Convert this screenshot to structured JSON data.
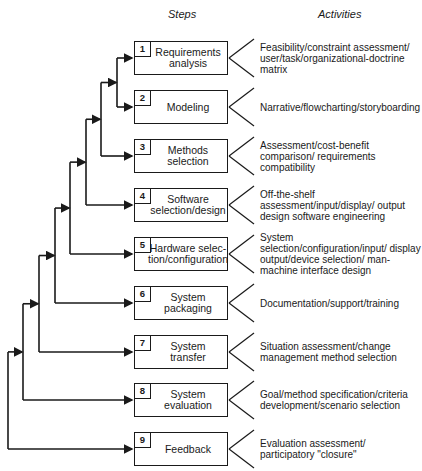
{
  "headers": {
    "steps": "Steps",
    "activities": "Activities"
  },
  "steps": [
    {
      "number": "1",
      "label": "Requirements\nanalysis",
      "activity": "Feasibility/constraint assessment/ user/task/organizational-doctrine matrix"
    },
    {
      "number": "2",
      "label": "Modeling",
      "activity": "Narrative/flowcharting/storyboarding"
    },
    {
      "number": "3",
      "label": "Methods\nselection",
      "activity": "Assessment/cost-benefit comparison/ requirements compatibility"
    },
    {
      "number": "4",
      "label": "Software\nselection/design",
      "activity": "Off-the-shelf assessment/input/display/ output design software engineering"
    },
    {
      "number": "5",
      "label": "Hardware selec-\ntion/configuration",
      "activity": "System selection/configuration/input/ display output/device selection/ man-machine interface design"
    },
    {
      "number": "6",
      "label": "System\npackaging",
      "activity": "Documentation/support/training"
    },
    {
      "number": "7",
      "label": "System\ntransfer",
      "activity": "Situation assessment/change management method selection"
    },
    {
      "number": "8",
      "label": "System\nevaluation",
      "activity": "Goal/method specification/criteria development/scenario selection"
    },
    {
      "number": "9",
      "label": "Feedback",
      "activity": "Evaluation assessment/ participatory \"closure\""
    }
  ],
  "colors": {
    "line": "#1a1a1a",
    "background": "#ffffff"
  }
}
